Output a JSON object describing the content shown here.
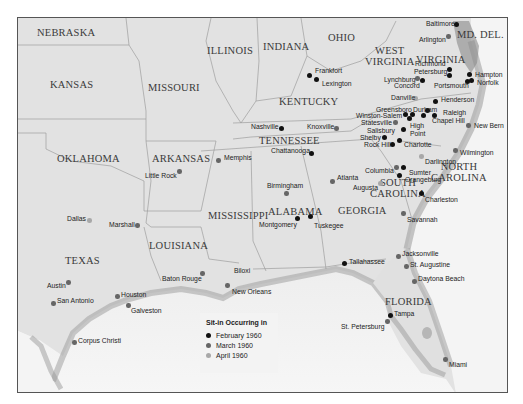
{
  "legend": {
    "title": "Sit-in Occurring in",
    "items": [
      {
        "label": "February 1960",
        "color": "#111111"
      },
      {
        "label": "March 1960",
        "color": "#666666"
      },
      {
        "label": "April 1960",
        "color": "#a8a8a8"
      }
    ]
  },
  "states": [
    {
      "name": "NEBRASKA",
      "x": 36,
      "y": 26
    },
    {
      "name": "KANSAS",
      "x": 49,
      "y": 78
    },
    {
      "name": "MISSOURI",
      "x": 147,
      "y": 81
    },
    {
      "name": "ILLINOIS",
      "x": 206,
      "y": 44
    },
    {
      "name": "INDIANA",
      "x": 262,
      "y": 40
    },
    {
      "name": "OHIO",
      "x": 327,
      "y": 31
    },
    {
      "name": "WEST\nVIRGINIA",
      "x": 364,
      "y": 44
    },
    {
      "name": "VIRGINIA",
      "x": 415,
      "y": 53
    },
    {
      "name": "MD. DEL.",
      "x": 456,
      "y": 28
    },
    {
      "name": "KENTUCKY",
      "x": 278,
      "y": 95
    },
    {
      "name": "TENNESSEE",
      "x": 258,
      "y": 134
    },
    {
      "name": "NORTH\nCAROLINA",
      "x": 430,
      "y": 160
    },
    {
      "name": "SOUTH\nCAROLINA",
      "x": 369,
      "y": 176
    },
    {
      "name": "OKLAHOMA",
      "x": 56,
      "y": 152
    },
    {
      "name": "ARKANSAS",
      "x": 151,
      "y": 152
    },
    {
      "name": "MISSISSIPPI",
      "x": 207,
      "y": 209
    },
    {
      "name": "ALABAMA",
      "x": 267,
      "y": 205
    },
    {
      "name": "GEORGIA",
      "x": 337,
      "y": 204
    },
    {
      "name": "LOUISIANA",
      "x": 148,
      "y": 239
    },
    {
      "name": "TEXAS",
      "x": 64,
      "y": 254
    },
    {
      "name": "FLORIDA",
      "x": 384,
      "y": 295
    }
  ],
  "cities": [
    {
      "name": "Baltimore",
      "month": "February",
      "dx": 455,
      "dy": 23,
      "lx": 425,
      "ly": 19
    },
    {
      "name": "Arlington",
      "month": "March",
      "dx": 447,
      "dy": 35,
      "lx": 418,
      "ly": 35
    },
    {
      "name": "Richmond",
      "month": "February",
      "dx": 448,
      "dy": 68,
      "lx": 414,
      "ly": 59
    },
    {
      "name": "Petersburg",
      "month": "February",
      "dx": 448,
      "dy": 74,
      "lx": 413,
      "ly": 67
    },
    {
      "name": "Lynchburg",
      "month": "March",
      "dx": 416,
      "dy": 77,
      "lx": 383,
      "ly": 75
    },
    {
      "name": "Concord",
      "month": "February",
      "dx": 421,
      "dy": 79,
      "lx": 393,
      "ly": 81
    },
    {
      "name": "Hampton",
      "month": "February",
      "dx": 468,
      "dy": 73,
      "lx": 474,
      "ly": 70
    },
    {
      "name": "Norfolk",
      "month": "February",
      "dx": 470,
      "dy": 79,
      "lx": 476,
      "ly": 78
    },
    {
      "name": "Portsmouth",
      "month": "February",
      "dx": 466,
      "dy": 80,
      "lx": 433,
      "ly": 81
    },
    {
      "name": "Frankfort",
      "month": "February",
      "dx": 308,
      "dy": 74,
      "lx": 314,
      "ly": 66
    },
    {
      "name": "Lexington",
      "month": "February",
      "dx": 315,
      "dy": 78,
      "lx": 321,
      "ly": 79
    },
    {
      "name": "Danville",
      "month": "April",
      "dx": 414,
      "dy": 97,
      "lx": 390,
      "ly": 93
    },
    {
      "name": "Henderson",
      "month": "February",
      "dx": 434,
      "dy": 100,
      "lx": 440,
      "ly": 95
    },
    {
      "name": "Greensboro",
      "month": "February",
      "dx": 404,
      "dy": 113,
      "lx": 375,
      "ly": 105
    },
    {
      "name": "Durham",
      "month": "February",
      "dx": 426,
      "dy": 109,
      "lx": 412,
      "ly": 105
    },
    {
      "name": "Raleigh",
      "month": "February",
      "dx": 433,
      "dy": 114,
      "lx": 442,
      "ly": 108
    },
    {
      "name": "Winston-Salem",
      "month": "February",
      "dx": 411,
      "dy": 113,
      "lx": 355,
      "ly": 111
    },
    {
      "name": "Chapel Hill",
      "month": "February",
      "dx": 422,
      "dy": 114,
      "lx": 431,
      "ly": 116
    },
    {
      "name": "Statesville",
      "month": "March",
      "dx": 394,
      "dy": 121,
      "lx": 360,
      "ly": 118
    },
    {
      "name": "High\nPoint",
      "month": "February",
      "dx": 408,
      "dy": 117,
      "lx": 409,
      "ly": 121
    },
    {
      "name": "Salisbury",
      "month": "February",
      "dx": 402,
      "dy": 128,
      "lx": 366,
      "ly": 126
    },
    {
      "name": "Nashville",
      "month": "February",
      "dx": 280,
      "dy": 127,
      "lx": 250,
      "ly": 122
    },
    {
      "name": "Knoxville",
      "month": "March",
      "dx": 335,
      "dy": 127,
      "lx": 306,
      "ly": 122
    },
    {
      "name": "Shelby",
      "month": "February",
      "dx": 383,
      "dy": 136,
      "lx": 359,
      "ly": 133
    },
    {
      "name": "New Bern",
      "month": "March",
      "dx": 467,
      "dy": 124,
      "lx": 473,
      "ly": 121
    },
    {
      "name": "Charlotte",
      "month": "February",
      "dx": 398,
      "dy": 139,
      "lx": 403,
      "ly": 140
    },
    {
      "name": "Rock Hill",
      "month": "February",
      "dx": 391,
      "dy": 143,
      "lx": 363,
      "ly": 140
    },
    {
      "name": "Chattanooga",
      "month": "February",
      "dx": 310,
      "dy": 152,
      "lx": 270,
      "ly": 146
    },
    {
      "name": "Memphis",
      "month": "March",
      "dx": 217,
      "dy": 159,
      "lx": 223,
      "ly": 153
    },
    {
      "name": "Little Rock",
      "month": "March",
      "dx": 178,
      "dy": 170,
      "lx": 144,
      "ly": 171
    },
    {
      "name": "Columbia",
      "month": "March",
      "dx": 395,
      "dy": 166,
      "lx": 364,
      "ly": 166
    },
    {
      "name": "Darlington",
      "month": "April",
      "dx": 420,
      "dy": 155,
      "lx": 424,
      "ly": 157
    },
    {
      "name": "Wilmington",
      "month": "March",
      "dx": 454,
      "dy": 149,
      "lx": 459,
      "ly": 148
    },
    {
      "name": "Sumter",
      "month": "February",
      "dx": 402,
      "dy": 166,
      "lx": 408,
      "ly": 168
    },
    {
      "name": "Orangeburg",
      "month": "February",
      "dx": 398,
      "dy": 174,
      "lx": 404,
      "ly": 175
    },
    {
      "name": "Atlanta",
      "month": "March",
      "dx": 331,
      "dy": 180,
      "lx": 336,
      "ly": 173
    },
    {
      "name": "Augusta",
      "month": "April",
      "dx": 379,
      "dy": 182,
      "lx": 352,
      "ly": 183
    },
    {
      "name": "Birmingham",
      "month": "March",
      "dx": 285,
      "dy": 192,
      "lx": 266,
      "ly": 181
    },
    {
      "name": "Charleston",
      "month": "February",
      "dx": 420,
      "dy": 192,
      "lx": 424,
      "ly": 195
    },
    {
      "name": "Dallas",
      "month": "April",
      "dx": 88,
      "dy": 219,
      "lx": 66,
      "ly": 214
    },
    {
      "name": "Marshall",
      "month": "March",
      "dx": 136,
      "dy": 224,
      "lx": 108,
      "ly": 220
    },
    {
      "name": "Montgomery",
      "month": "February",
      "dx": 296,
      "dy": 217,
      "lx": 258,
      "ly": 220
    },
    {
      "name": "Tuskegee",
      "month": "February",
      "dx": 309,
      "dy": 215,
      "lx": 313,
      "ly": 221
    },
    {
      "name": "Savannah",
      "month": "March",
      "dx": 402,
      "dy": 212,
      "lx": 406,
      "ly": 215
    },
    {
      "name": "Austin",
      "month": "March",
      "dx": 67,
      "dy": 281,
      "lx": 46,
      "ly": 281
    },
    {
      "name": "Baton Rouge",
      "month": "March",
      "dx": 201,
      "dy": 272,
      "lx": 161,
      "ly": 274
    },
    {
      "name": "Biloxi",
      "month": "Other",
      "dx": 0,
      "dy": 0,
      "lx": 233,
      "ly": 266
    },
    {
      "name": "Jacksonville",
      "month": "March",
      "dx": 397,
      "dy": 255,
      "lx": 401,
      "ly": 249
    },
    {
      "name": "St. Augustine",
      "month": "March",
      "dx": 405,
      "dy": 265,
      "lx": 409,
      "ly": 260
    },
    {
      "name": "Tallahassee",
      "month": "February",
      "dx": 343,
      "dy": 262,
      "lx": 348,
      "ly": 257
    },
    {
      "name": "Houston",
      "month": "March",
      "dx": 116,
      "dy": 295,
      "lx": 120,
      "ly": 290
    },
    {
      "name": "New Orleans",
      "month": "March",
      "dx": 226,
      "dy": 284,
      "lx": 231,
      "ly": 287
    },
    {
      "name": "San Antonio",
      "month": "March",
      "dx": 52,
      "dy": 302,
      "lx": 56,
      "ly": 296
    },
    {
      "name": "Galveston",
      "month": "March",
      "dx": 127,
      "dy": 304,
      "lx": 130,
      "ly": 306
    },
    {
      "name": "Daytona Beach",
      "month": "March",
      "dx": 413,
      "dy": 280,
      "lx": 417,
      "ly": 274
    },
    {
      "name": "Tampa",
      "month": "February",
      "dx": 389,
      "dy": 314,
      "lx": 393,
      "ly": 309
    },
    {
      "name": "St. Petersburg",
      "month": "March",
      "dx": 386,
      "dy": 320,
      "lx": 340,
      "ly": 322
    },
    {
      "name": "Corpus Christi",
      "month": "March",
      "dx": 73,
      "dy": 341,
      "lx": 77,
      "ly": 336
    },
    {
      "name": "Miami",
      "month": "March",
      "dx": 444,
      "dy": 358,
      "lx": 448,
      "ly": 360
    }
  ]
}
